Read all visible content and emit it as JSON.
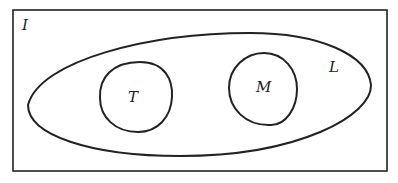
{
  "diagram": {
    "type": "venn",
    "universe": {
      "label": "I"
    },
    "sets": [
      {
        "label": "L",
        "contains": [
          "T",
          "M"
        ]
      },
      {
        "label": "T"
      },
      {
        "label": "M"
      }
    ],
    "stroke_color": "#222222",
    "background": "#ffffff"
  }
}
